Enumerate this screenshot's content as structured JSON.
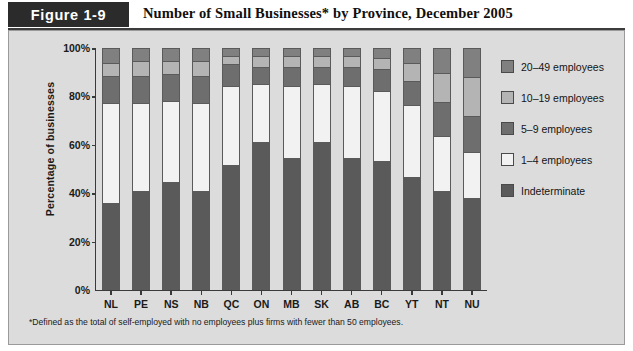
{
  "header": {
    "figure_tag": "Figure 1-9",
    "title": "Number of Small Businesses* by Province, December 2005"
  },
  "footnote": "*Defined as the total of self-employed with no employees plus firms with fewer than 50 employees.",
  "colors": {
    "indeterminate": "#5a5a5a",
    "emp_1_4": "#f2f2f2",
    "emp_5_9": "#6e6e6e",
    "emp_10_19": "#b4b4b4",
    "emp_20_49": "#808080",
    "panel_background": "#dcdcdc",
    "axis": "#3a3a3a",
    "tag_background": "#2b2b2b"
  },
  "chart_data": {
    "type": "bar",
    "subtype": "stacked-bar-100-percent",
    "title": "Number of Small Businesses* by Province, December 2005",
    "xlabel": "",
    "ylabel": "Percentage of businesses",
    "ylim": [
      0,
      100
    ],
    "yticks": [
      "0%",
      "20%",
      "40%",
      "60%",
      "80%",
      "100%"
    ],
    "ytick_values": [
      0,
      20,
      40,
      60,
      80,
      100
    ],
    "grid": false,
    "legend_position": "right",
    "categories": [
      "NL",
      "PE",
      "NS",
      "NB",
      "QC",
      "ON",
      "MB",
      "SK",
      "AB",
      "BC",
      "YT",
      "NT",
      "NU"
    ],
    "series": [
      {
        "name": "Indeterminate",
        "color": "#5a5a5a",
        "values": [
          36,
          41,
          45,
          41,
          52,
          62,
          55,
          62,
          55,
          54,
          47,
          41,
          38
        ]
      },
      {
        "name": "1–4 employees",
        "color": "#f2f2f2",
        "values": [
          42,
          37,
          34,
          37,
          33,
          24,
          30,
          24,
          30,
          29,
          30,
          23,
          19
        ]
      },
      {
        "name": "5–9 employees",
        "color": "#6e6e6e",
        "values": [
          11,
          11,
          11,
          11,
          9,
          7,
          8,
          7,
          8,
          9,
          10,
          14,
          15
        ]
      },
      {
        "name": "10–19 employees",
        "color": "#b4b4b4",
        "values": [
          5,
          6,
          5,
          6,
          3,
          4,
          4,
          4,
          4,
          4,
          7,
          12,
          16
        ]
      },
      {
        "name": "20–49 employees",
        "color": "#808080",
        "values": [
          6,
          5,
          5,
          5,
          3,
          3,
          3,
          3,
          3,
          4,
          6,
          10,
          12
        ]
      }
    ],
    "legend": [
      {
        "label": "20–49 employees",
        "color": "#808080"
      },
      {
        "label": "10–19 employees",
        "color": "#b4b4b4"
      },
      {
        "label": "5–9 employees",
        "color": "#6e6e6e"
      },
      {
        "label": "1–4 employees",
        "color": "#f2f2f2"
      },
      {
        "label": "Indeterminate",
        "color": "#5a5a5a"
      }
    ]
  }
}
